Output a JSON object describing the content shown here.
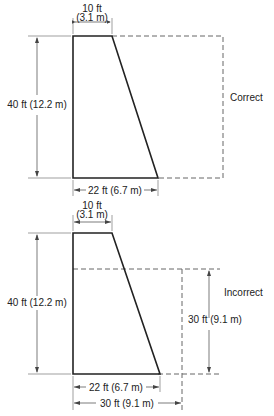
{
  "figures": [
    {
      "id": "correct",
      "caption": "Correct",
      "top_width_ft": "10 ft",
      "top_width_m": "(3.1 m)",
      "height_label": "40 ft (12.2 m)",
      "base_label": "22 ft (6.7 m)"
    },
    {
      "id": "incorrect",
      "caption": "Incorrect",
      "top_width_ft": "10 ft",
      "top_width_m": "(3.1 m)",
      "height_label": "40 ft (12.2 m)",
      "base_label": "22 ft (6.7 m)",
      "dashed_height_label": "30 ft (9.1 m)",
      "dashed_base_label": "30 ft (9.1 m)"
    }
  ],
  "colors": {
    "stroke": "#222222",
    "dim": "#555555",
    "dashed": "#666666"
  }
}
